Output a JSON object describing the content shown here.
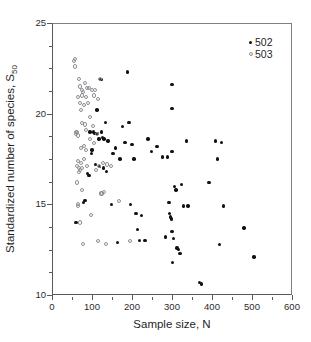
{
  "chart_data": {
    "type": "scatter",
    "title": "",
    "xlabel": "Sample size, N",
    "ylabel": "Standardized number of species, S50",
    "ylabel_base": "Standardized number of species, S",
    "ylabel_sub": "50",
    "xlim": [
      0,
      600
    ],
    "ylim": [
      10,
      25
    ],
    "xticks": [
      0,
      100,
      200,
      300,
      400,
      500,
      600
    ],
    "xticklabels": [
      "0",
      "100",
      "200",
      "300",
      "400",
      "500",
      "600"
    ],
    "xminorticks": [
      50,
      150,
      250,
      350,
      450,
      550
    ],
    "yticks": [
      10,
      15,
      20,
      25
    ],
    "yticklabels": [
      "10",
      "15",
      "20",
      "25"
    ],
    "yminorticks": [
      11.25,
      12.5,
      13.75,
      16.25,
      17.5,
      18.75,
      21.25,
      22.5,
      23.75
    ],
    "grid": false,
    "legend_position": "top-right",
    "series": [
      {
        "name": "502",
        "marker": "filled-circle",
        "color": "#111111",
        "points": [
          [
            60,
            14.0
          ],
          [
            78,
            15.1
          ],
          [
            82,
            15.2
          ],
          [
            88,
            16.7
          ],
          [
            92,
            16.6
          ],
          [
            95,
            19.0
          ],
          [
            98,
            17.8
          ],
          [
            100,
            18.0
          ],
          [
            103,
            19.0
          ],
          [
            106,
            18.9
          ],
          [
            108,
            17.2
          ],
          [
            110,
            18.9
          ],
          [
            112,
            20.2
          ],
          [
            114,
            18.9
          ],
          [
            117,
            18.6
          ],
          [
            119,
            17.1
          ],
          [
            122,
            21.9
          ],
          [
            124,
            19.0
          ],
          [
            126,
            18.7
          ],
          [
            128,
            17.0
          ],
          [
            130,
            18.6
          ],
          [
            133,
            19.5
          ],
          [
            136,
            16.8
          ],
          [
            140,
            18.5
          ],
          [
            148,
            15.0
          ],
          [
            152,
            17.8
          ],
          [
            158,
            18.1
          ],
          [
            164,
            12.9
          ],
          [
            170,
            17.5
          ],
          [
            176,
            19.3
          ],
          [
            182,
            18.4
          ],
          [
            188,
            22.3
          ],
          [
            192,
            19.5
          ],
          [
            196,
            15.0
          ],
          [
            200,
            18.3
          ],
          [
            205,
            17.5
          ],
          [
            210,
            14.5
          ],
          [
            214,
            13.6
          ],
          [
            218,
            13.0
          ],
          [
            224,
            14.4
          ],
          [
            232,
            13.0
          ],
          [
            240,
            18.6
          ],
          [
            248,
            17.9
          ],
          [
            262,
            18.2
          ],
          [
            276,
            17.6
          ],
          [
            284,
            13.2
          ],
          [
            288,
            17.6
          ],
          [
            292,
            15.1
          ],
          [
            294,
            14.5
          ],
          [
            296,
            14.3
          ],
          [
            298,
            14.2
          ],
          [
            300,
            21.6
          ],
          [
            300,
            20.3
          ],
          [
            300,
            17.9
          ],
          [
            300,
            13.5
          ],
          [
            301,
            11.8
          ],
          [
            304,
            13.1
          ],
          [
            306,
            16.0
          ],
          [
            310,
            15.8
          ],
          [
            312,
            12.6
          ],
          [
            316,
            12.5
          ],
          [
            320,
            12.3
          ],
          [
            324,
            16.1
          ],
          [
            328,
            14.9
          ],
          [
            336,
            18.5
          ],
          [
            340,
            14.9
          ],
          [
            368,
            10.7
          ],
          [
            373,
            10.6
          ],
          [
            392,
            16.2
          ],
          [
            408,
            18.5
          ],
          [
            413,
            17.5
          ],
          [
            418,
            12.8
          ],
          [
            424,
            18.4
          ],
          [
            428,
            14.9
          ],
          [
            480,
            13.7
          ],
          [
            505,
            12.1
          ]
        ]
      },
      {
        "name": "503",
        "marker": "open-circle",
        "color": "#8d9093",
        "points": [
          [
            54,
            22.9
          ],
          [
            58,
            23.0
          ],
          [
            57,
            22.6
          ],
          [
            59,
            19.0
          ],
          [
            60,
            18.9
          ],
          [
            62,
            19.0
          ],
          [
            62,
            17.1
          ],
          [
            63,
            16.2
          ],
          [
            64,
            18.8
          ],
          [
            64,
            15.0
          ],
          [
            65,
            14.9
          ],
          [
            66,
            20.9
          ],
          [
            66,
            17.4
          ],
          [
            67,
            16.8
          ],
          [
            68,
            21.9
          ],
          [
            68,
            17.0
          ],
          [
            69,
            14.0
          ],
          [
            70,
            20.6
          ],
          [
            70,
            16.9
          ],
          [
            71,
            21.5
          ],
          [
            72,
            20.2
          ],
          [
            72,
            17.3
          ],
          [
            73,
            18.1
          ],
          [
            74,
            21.0
          ],
          [
            74,
            19.5
          ],
          [
            75,
            17.0
          ],
          [
            76,
            21.3
          ],
          [
            76,
            15.8
          ],
          [
            77,
            12.8
          ],
          [
            78,
            21.2
          ],
          [
            79,
            18.2
          ],
          [
            80,
            20.5
          ],
          [
            81,
            17.5
          ],
          [
            82,
            21.7
          ],
          [
            83,
            19.4
          ],
          [
            84,
            20.9
          ],
          [
            85,
            18.0
          ],
          [
            86,
            19.1
          ],
          [
            87,
            17.1
          ],
          [
            88,
            21.4
          ],
          [
            90,
            20.6
          ],
          [
            92,
            21.4
          ],
          [
            94,
            19.8
          ],
          [
            96,
            18.6
          ],
          [
            98,
            14.4
          ],
          [
            100,
            21.3
          ],
          [
            102,
            19.3
          ],
          [
            104,
            18.4
          ],
          [
            106,
            21.0
          ],
          [
            108,
            21.3
          ],
          [
            110,
            16.9
          ],
          [
            112,
            18.9
          ],
          [
            114,
            20.8
          ],
          [
            116,
            13.0
          ],
          [
            118,
            17.1
          ],
          [
            120,
            21.9
          ],
          [
            122,
            15.6
          ],
          [
            124,
            15.6
          ],
          [
            127,
            17.3
          ],
          [
            130,
            15.7
          ],
          [
            134,
            12.8
          ],
          [
            138,
            17.2
          ],
          [
            148,
            17.1
          ],
          [
            168,
            15.2
          ],
          [
            196,
            13.0
          ]
        ]
      }
    ],
    "legend": [
      {
        "label": "502",
        "marker": "filled-circle"
      },
      {
        "label": "503",
        "marker": "open-circle"
      }
    ]
  }
}
